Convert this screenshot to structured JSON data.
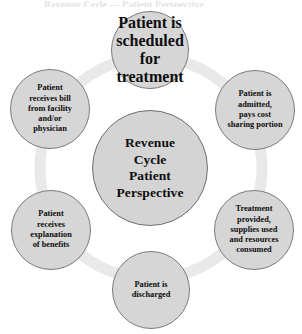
{
  "diagram": {
    "kind": "cycle-diagram",
    "caption_remnant": "Revenue Cycle — Patient Perspective",
    "colors": {
      "node_fill": "#d6d6d6",
      "node_border": "#7b7b7b",
      "center_fill": "#d4d4d4",
      "center_border": "#6f6f6f",
      "ring": "#e9e9e9",
      "text": "#0d0d0d",
      "background": "#ffffff"
    },
    "center": {
      "label": "Revenue\nCycle\nPatient\nPerspective"
    },
    "ring": {
      "center_x": 151,
      "center_y": 168,
      "radius": 111,
      "stroke_width": 11
    },
    "steps": [
      {
        "id": "scheduled",
        "order": 1,
        "label": "Patient is\nscheduled for\ntreatment",
        "position": "top"
      },
      {
        "id": "admitted",
        "order": 2,
        "label": "Patient is\nadmitted,\npays cost\nsharing  portion",
        "position": "top-right"
      },
      {
        "id": "treatment",
        "order": 3,
        "label": "Treatment\nprovided,\nsupplies used\nand resources\nconsumed",
        "position": "bottom-right"
      },
      {
        "id": "discharged",
        "order": 4,
        "label": "Patient is\ndischarged",
        "position": "bottom"
      },
      {
        "id": "eob",
        "order": 5,
        "label": "Patient\nreceives\nexplanation\nof  benefits",
        "position": "bottom-left"
      },
      {
        "id": "bill",
        "order": 6,
        "label": "Patient\nreceives bill\nfrom facility\nand/or\nphysician",
        "position": "top-left"
      }
    ]
  }
}
